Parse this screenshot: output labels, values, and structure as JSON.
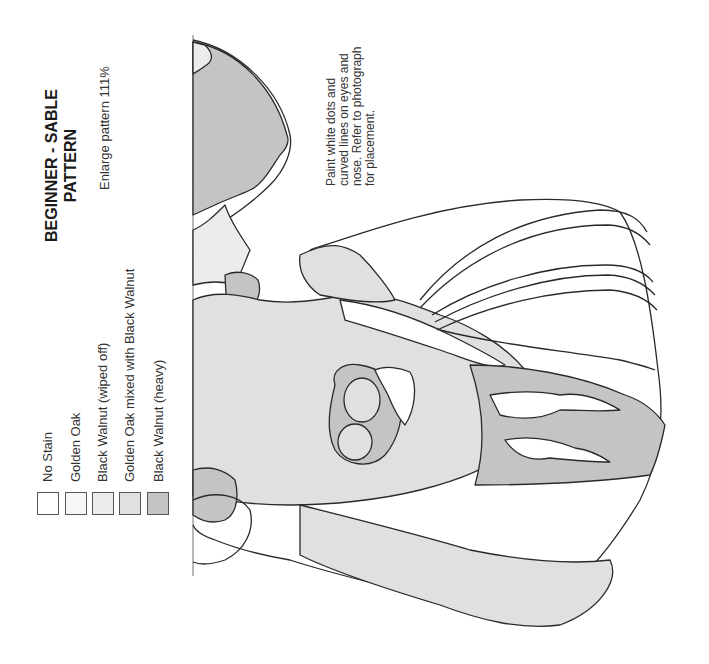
{
  "title": {
    "line1": "BEGINNER - SABLE",
    "line2": "PATTERN"
  },
  "subtitle": "Enlarge pattern 111%",
  "note": "Paint white dots and curved lines on eyes and nose. Refer to photograph for placement.",
  "legend": {
    "items": [
      {
        "label": "No Stain",
        "color": "#ffffff"
      },
      {
        "label": "Golden Oak",
        "color": "#f6f6f6"
      },
      {
        "label": "Black Walnut (wiped off)",
        "color": "#ececec"
      },
      {
        "label": "Golden Oak mixed with Black Walnut",
        "color": "#e0e0e0"
      },
      {
        "label": "Black Walnut (heavy)",
        "color": "#c4c4c4"
      }
    ]
  },
  "colors": {
    "outline": "#2a2a2a",
    "no_stain": "#ffffff",
    "golden_oak": "#f6f6f6",
    "walnut_wiped": "#ececec",
    "oak_walnut_mix": "#e0e0e0",
    "walnut_heavy": "#c4c4c4"
  }
}
